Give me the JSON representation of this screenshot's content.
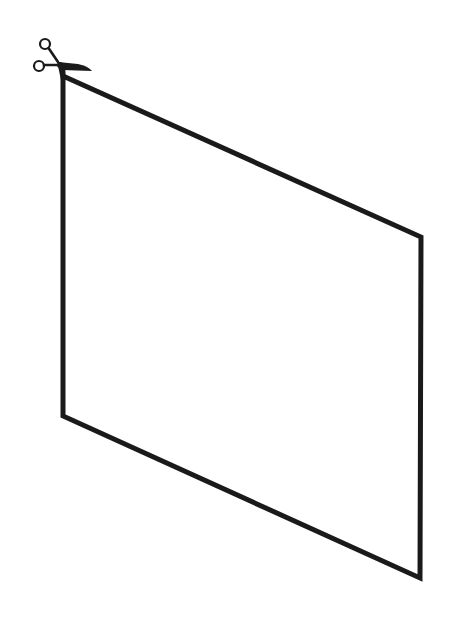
{
  "diagram": {
    "shape": "parallelogram",
    "stroke_color": "#1a1a1a",
    "background_color": "#ffffff",
    "stroke_width": 5,
    "vertices": {
      "top_left": [
        63,
        76
      ],
      "top_right": [
        421,
        237
      ],
      "bottom_right": [
        420,
        578
      ],
      "bottom_left": [
        63,
        416
      ]
    },
    "icons": [
      {
        "name": "scissors-icon",
        "position": [
          63,
          66
        ]
      }
    ]
  }
}
